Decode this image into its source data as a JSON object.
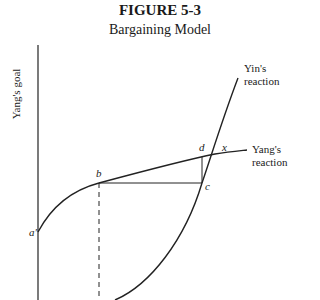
{
  "figure": {
    "number": "FIGURE 5-3",
    "title": "Bargaining Model",
    "ylabel": "Yang's goal"
  },
  "labels": {
    "yin_curve": [
      "Yin's",
      "reaction"
    ],
    "yang_curve": [
      "Yang's",
      "reaction"
    ],
    "points": {
      "a": "a'",
      "b": "b",
      "c": "c",
      "d": "d",
      "x": "x"
    }
  }
}
